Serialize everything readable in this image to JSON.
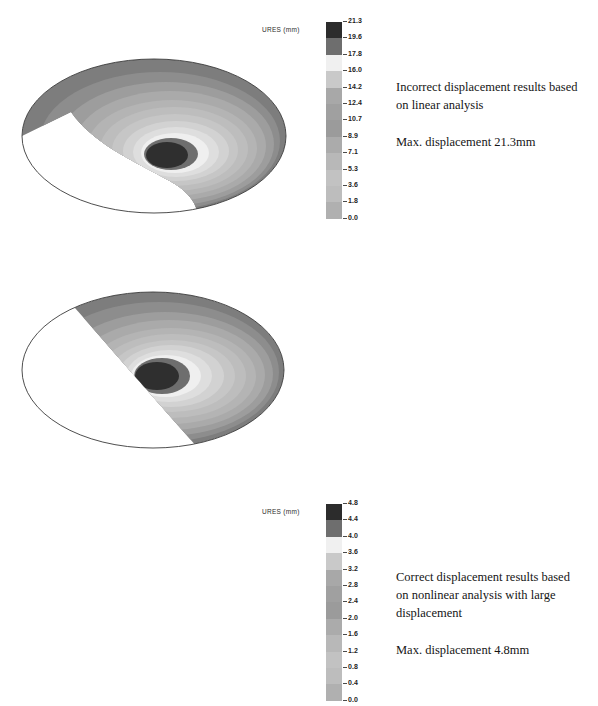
{
  "document": {
    "title": "Linear vs. Nonlinear Large Displacement FEA Comparison"
  },
  "panels": [
    {
      "id": "linear",
      "legend": {
        "title": "URES (mm)",
        "title_icon": "legend-title-label",
        "unit": "mm",
        "quantity": "URES",
        "labels": [
          "21.3",
          "19.6",
          "17.8",
          "16.0",
          "14.2",
          "12.4",
          "10.7",
          "8.9",
          "7.1",
          "5.3",
          "3.6",
          "1.8",
          "0.0"
        ],
        "colors": [
          "#2c2c2c",
          "#6e6e6e",
          "#f0f0f0",
          "#c9c9c9",
          "#a8a8a8",
          "#a0a0a0",
          "#9b9b9b",
          "#ababab",
          "#b8b8b8",
          "#c2c2c2",
          "#bdbdbd",
          "#b0b0b0",
          "#a6a6a6"
        ]
      },
      "caption": {
        "line1": "Incorrect displacement results based",
        "line2": "on linear analysis",
        "line3": "Max. displacement 21.3mm"
      }
    },
    {
      "id": "nonlinear",
      "legend": {
        "title": "URES (mm)",
        "title_icon": "legend-title-label",
        "unit": "mm",
        "quantity": "URES",
        "labels": [
          "4.8",
          "4.4",
          "4.0",
          "3.6",
          "3.2",
          "2.8",
          "2.4",
          "2.0",
          "1.6",
          "1.2",
          "0.8",
          "0.4",
          "0.0"
        ],
        "colors": [
          "#2c2c2c",
          "#6e6e6e",
          "#f0f0f0",
          "#c9c9c9",
          "#a8a8a8",
          "#a0a0a0",
          "#9b9b9b",
          "#ababab",
          "#b8b8b8",
          "#c2c2c2",
          "#bdbdbd",
          "#b0b0b0",
          "#a6a6a6"
        ]
      },
      "caption": {
        "line1": "Correct displacement results based",
        "line2": "on nonlinear analysis with large",
        "line3": "displacement",
        "line4": "Max. displacement 4.8mm"
      }
    }
  ],
  "chart_data": [
    {
      "type": "heatmap",
      "title": "Incorrect displacement results based on linear analysis",
      "quantity": "URES",
      "unit": "mm",
      "geometry": "elliptical shell plate, lower-left sector undeformed (white)",
      "colorbar_ticks": [
        21.3,
        19.6,
        17.8,
        16.0,
        14.2,
        12.4,
        10.7,
        8.9,
        7.1,
        5.3,
        3.6,
        1.8,
        0.0
      ],
      "vmin": 0.0,
      "vmax": 21.3,
      "max_displacement": 21.3,
      "n_bands": 13,
      "legend_position": "right of plot",
      "band_centers_mm": [
        20.45,
        18.7,
        16.9,
        15.1,
        13.3,
        11.55,
        9.8,
        8.0,
        6.2,
        4.45,
        2.7,
        0.9
      ],
      "contour_center": {
        "x_frac": 0.52,
        "y_frac": 0.59
      }
    },
    {
      "type": "heatmap",
      "title": "Correct displacement results based on nonlinear analysis with large displacement",
      "quantity": "URES",
      "unit": "mm",
      "geometry": "elliptical shell plate, lower-left sector undeformed (white)",
      "colorbar_ticks": [
        4.8,
        4.4,
        4.0,
        3.6,
        3.2,
        2.8,
        2.4,
        2.0,
        1.6,
        1.2,
        0.8,
        0.4,
        0.0
      ],
      "vmin": 0.0,
      "vmax": 4.8,
      "max_displacement": 4.8,
      "n_bands": 13,
      "legend_position": "right of plot",
      "band_centers_mm": [
        4.6,
        4.2,
        3.8,
        3.4,
        3.0,
        2.6,
        2.2,
        1.8,
        1.4,
        1.0,
        0.6,
        0.2
      ],
      "contour_center": {
        "x_frac": 0.52,
        "y_frac": 0.55
      }
    }
  ]
}
